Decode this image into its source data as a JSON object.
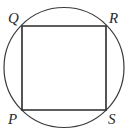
{
  "diagram": {
    "type": "inscribed-square-in-circle",
    "circle": {
      "cx": 64,
      "cy": 67.5,
      "r": 60,
      "stroke": "#3a3a3a",
      "stroke_width": 1.2
    },
    "square": {
      "stroke": "#2a2a2a",
      "stroke_width": 1.6,
      "vertices": [
        {
          "name": "Q",
          "x": 22,
          "y": 26
        },
        {
          "name": "R",
          "x": 106,
          "y": 26
        },
        {
          "name": "S",
          "x": 106,
          "y": 110
        },
        {
          "name": "P",
          "x": 22,
          "y": 110
        }
      ]
    },
    "labels": {
      "Q": {
        "text": "Q",
        "x": 8,
        "y": 23
      },
      "R": {
        "text": "R",
        "x": 109,
        "y": 23
      },
      "P": {
        "text": "P",
        "x": 8,
        "y": 124
      },
      "S": {
        "text": "S",
        "x": 108,
        "y": 124
      }
    }
  }
}
